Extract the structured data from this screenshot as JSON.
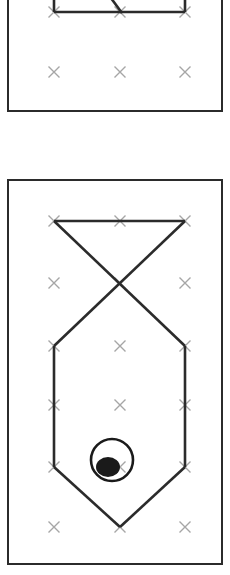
{
  "canvas": {
    "width": 230,
    "height": 575,
    "background_color": "#ffffff"
  },
  "style": {
    "panel_border_color": "#2b2b2b",
    "panel_border_width": 2,
    "panel_fill_color": "#ffffff",
    "play_line_color": "#2b2b2b",
    "play_line_width": 2.6,
    "marker_color": "#a6a6a6",
    "marker_stroke_width": 1.4,
    "ball_color": "#1a1a1a"
  },
  "grid": {
    "label": "player position grid",
    "columns_x": [
      52,
      118,
      183
    ],
    "marker_glyph": "x",
    "marker_size": 11
  },
  "panels": [
    {
      "id": "panel-top",
      "name": "upper-diagram-panel",
      "clipped": true,
      "note": "partially cut off at top edge of screenshot",
      "frame": {
        "x": 7,
        "y": -62,
        "width": 216,
        "height": 174
      },
      "marker_rows_y": [
        10,
        70
      ],
      "markers": [
        {
          "x": 52,
          "y": 10
        },
        {
          "x": 118,
          "y": 10
        },
        {
          "x": 183,
          "y": 10
        },
        {
          "x": 52,
          "y": 70
        },
        {
          "x": 118,
          "y": 70
        },
        {
          "x": 183,
          "y": 70
        }
      ],
      "shapes": [
        {
          "name": "top-horizontal-segment",
          "type": "polyline",
          "points": [
            [
              52,
              10
            ],
            [
              183,
              10
            ]
          ]
        },
        {
          "name": "left-vertical-stub",
          "type": "polyline",
          "points": [
            [
              52,
              -10
            ],
            [
              52,
              10
            ]
          ]
        },
        {
          "name": "right-vertical-stub",
          "type": "polyline",
          "points": [
            [
              183,
              -10
            ],
            [
              183,
              10
            ]
          ]
        },
        {
          "name": "center-diagonal-stub",
          "type": "polyline",
          "points": [
            [
              103,
              -12
            ],
            [
              120,
              11
            ]
          ]
        }
      ],
      "ball": null
    },
    {
      "id": "panel-bottom",
      "name": "lower-diagram-panel",
      "clipped": false,
      "note": "complete panel with full play shape and ball marker",
      "frame": {
        "x": 7,
        "y": 179,
        "width": 216,
        "height": 386
      },
      "marker_rows_y": [
        219,
        281,
        344,
        403,
        465,
        525
      ],
      "markers": [
        {
          "x": 52,
          "y": 219
        },
        {
          "x": 118,
          "y": 219
        },
        {
          "x": 183,
          "y": 219
        },
        {
          "x": 52,
          "y": 281
        },
        {
          "x": 118,
          "y": 281
        },
        {
          "x": 183,
          "y": 281
        },
        {
          "x": 52,
          "y": 344
        },
        {
          "x": 118,
          "y": 344
        },
        {
          "x": 183,
          "y": 344
        },
        {
          "x": 52,
          "y": 403
        },
        {
          "x": 118,
          "y": 403
        },
        {
          "x": 183,
          "y": 403
        },
        {
          "x": 52,
          "y": 465
        },
        {
          "x": 118,
          "y": 465
        },
        {
          "x": 183,
          "y": 465
        },
        {
          "x": 52,
          "y": 525
        },
        {
          "x": 118,
          "y": 525
        },
        {
          "x": 183,
          "y": 525
        }
      ],
      "shapes": [
        {
          "name": "top-horizontal-segment",
          "type": "polyline",
          "points": [
            [
              52,
              219
            ],
            [
              183,
              219
            ]
          ]
        },
        {
          "name": "crossing-diagonal-left-to-right",
          "type": "polyline",
          "points": [
            [
              52,
              219
            ],
            [
              183,
              344
            ]
          ]
        },
        {
          "name": "crossing-diagonal-right-to-left",
          "type": "polyline",
          "points": [
            [
              183,
              219
            ],
            [
              52,
              344
            ]
          ]
        },
        {
          "name": "left-vertical-side",
          "type": "polyline",
          "points": [
            [
              52,
              344
            ],
            [
              52,
              465
            ]
          ]
        },
        {
          "name": "right-vertical-side",
          "type": "polyline",
          "points": [
            [
              183,
              344
            ],
            [
              183,
              465
            ]
          ]
        },
        {
          "name": "home-plate-left-bevel",
          "type": "polyline",
          "points": [
            [
              52,
              465
            ],
            [
              118,
              525
            ]
          ]
        },
        {
          "name": "home-plate-right-bevel",
          "type": "polyline",
          "points": [
            [
              183,
              465
            ],
            [
              118,
              525
            ]
          ]
        }
      ],
      "ball": {
        "name": "ball-marker",
        "ring": {
          "cx": 110,
          "cy": 458,
          "r": 21
        },
        "dot": {
          "cx": 106,
          "cy": 465,
          "rx": 12,
          "ry": 10
        }
      }
    }
  ]
}
